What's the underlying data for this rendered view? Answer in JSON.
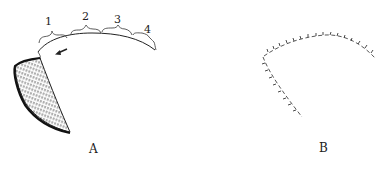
{
  "figure": {
    "panels": [
      {
        "id": "A",
        "label": "A",
        "segments": [
          "1",
          "2",
          "3",
          "4"
        ],
        "elements": [
          "curved-arc",
          "segment-braces",
          "direction-arrow",
          "hatched-crescent"
        ]
      },
      {
        "id": "B",
        "label": "B",
        "elements": [
          "ticked-dashed-arc",
          "ticked-dashed-descending-line"
        ]
      }
    ],
    "colors": {
      "ink": "#222222",
      "background": "#ffffff"
    }
  }
}
